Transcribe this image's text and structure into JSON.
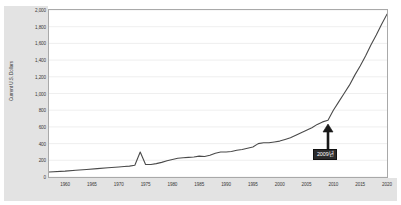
{
  "chart_data": {
    "type": "line",
    "title": "",
    "subtitle": "",
    "xlabel": "",
    "ylabel": "Current U.S. Dollars",
    "xlim": [
      1957,
      2020
    ],
    "ylim": [
      0,
      2000
    ],
    "grid": true,
    "legend": null,
    "y_ticks": [
      "2,000",
      "1,800",
      "1,600",
      "1,400",
      "1,200",
      "1,000",
      "800",
      "600",
      "400",
      "200",
      "0"
    ],
    "y_tick_values": [
      2000,
      1800,
      1600,
      1400,
      1200,
      1000,
      800,
      600,
      400,
      200,
      0
    ],
    "x_ticks": [
      "1960",
      "1965",
      "1970",
      "1975",
      "1980",
      "1985",
      "1990",
      "1995",
      "2000",
      "2005",
      "2010",
      "2015",
      "2020"
    ],
    "x_tick_values": [
      1960,
      1965,
      1970,
      1975,
      1980,
      1985,
      1990,
      1995,
      2000,
      2005,
      2010,
      2015,
      2020
    ],
    "series": [
      {
        "name": "Current U.S. Dollars",
        "color": "#4a4a4a",
        "x": [
          1957,
          1960,
          1962,
          1964,
          1966,
          1968,
          1970,
          1971,
          1972,
          1973,
          1974,
          1975,
          1976,
          1977,
          1978,
          1979,
          1980,
          1981,
          1982,
          1983,
          1984,
          1985,
          1986,
          1987,
          1988,
          1989,
          1990,
          1991,
          1992,
          1993,
          1994,
          1995,
          1996,
          1997,
          1998,
          1999,
          2000,
          2001,
          2002,
          2003,
          2004,
          2005,
          2006,
          2007,
          2008,
          2009,
          2010,
          2011,
          2012,
          2013,
          2014,
          2015,
          2016,
          2017,
          2018,
          2019,
          2020
        ],
        "y": [
          60,
          70,
          80,
          90,
          100,
          110,
          120,
          125,
          130,
          140,
          300,
          150,
          150,
          160,
          175,
          195,
          210,
          225,
          230,
          235,
          240,
          250,
          245,
          260,
          285,
          300,
          300,
          305,
          320,
          330,
          345,
          360,
          400,
          410,
          410,
          420,
          430,
          450,
          470,
          500,
          530,
          560,
          590,
          630,
          660,
          680,
          800,
          900,
          1000,
          1100,
          1220,
          1330,
          1450,
          1580,
          1700,
          1830,
          1950
        ]
      }
    ],
    "annotations": [
      {
        "label": "2009년",
        "x": 2009,
        "y": 680,
        "style": "dark-box-with-arrow"
      }
    ]
  },
  "annotation": {
    "label": "2009년"
  }
}
